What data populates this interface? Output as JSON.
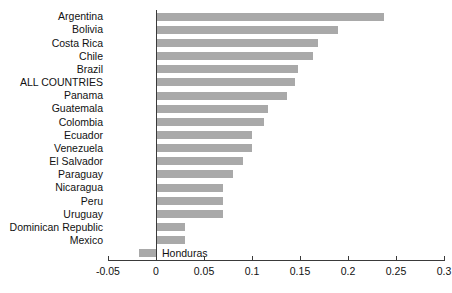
{
  "chart_data": {
    "type": "bar",
    "orientation": "horizontal",
    "title": "",
    "subtitle": "",
    "xlabel": "",
    "ylabel": "",
    "xlim": [
      -0.05,
      0.3
    ],
    "xticks": [
      "-0.05",
      "0",
      "0.05",
      "0.1",
      "0.15",
      "0.2",
      "0.25",
      "0.3"
    ],
    "xtick_values": [
      -0.05,
      0,
      0.05,
      0.1,
      0.15,
      0.2,
      0.25,
      0.3
    ],
    "grid": false,
    "legend": "none",
    "bar_color": "#a9a9a9",
    "axis_color": "#3a3a3a",
    "categories": [
      "Argentina",
      "Bolivia",
      "Costa Rica",
      "Chile",
      "Brazil",
      "ALL COUNTRIES",
      "Panama",
      "Guatemala",
      "Colombia",
      "Ecuador",
      "Venezuela",
      "El Salvador",
      "Paraguay",
      "Nicaragua",
      "Peru",
      "Uruguay",
      "Dominican Republic",
      "Mexico",
      "Honduras"
    ],
    "values": [
      0.238,
      0.19,
      0.169,
      0.164,
      0.148,
      0.145,
      0.136,
      0.117,
      0.112,
      0.1,
      0.1,
      0.091,
      0.08,
      0.07,
      0.07,
      0.07,
      0.03,
      0.03,
      -0.018
    ],
    "label_placement": [
      "outside-left",
      "outside-left",
      "outside-left",
      "outside-left",
      "outside-left",
      "outside-left",
      "outside-left",
      "outside-left",
      "outside-left",
      "outside-left",
      "outside-left",
      "outside-left",
      "outside-left",
      "outside-left",
      "outside-left",
      "outside-left",
      "outside-left",
      "outside-left",
      "inside-right"
    ]
  }
}
